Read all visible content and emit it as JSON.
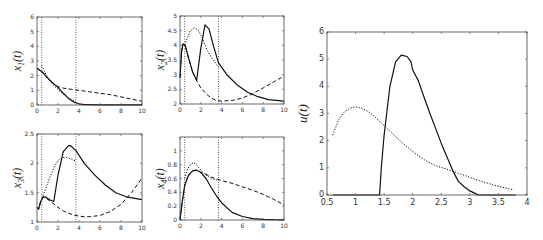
{
  "chart_data": [
    {
      "type": "line",
      "id": "x1",
      "ylabel": "x_1(t)",
      "ylabel_main": "x",
      "ylabel_sub": "1",
      "xlim": [
        0,
        10
      ],
      "ylim": [
        0,
        6
      ],
      "xticks": [
        0,
        2,
        4,
        6,
        8,
        10
      ],
      "yticks": [
        0,
        1,
        2,
        3,
        4,
        5,
        6
      ],
      "vlines": [
        0.45,
        3.7
      ],
      "series": [
        {
          "name": "solid",
          "style": "solid",
          "x": [
            0,
            0.5,
            1,
            1.5,
            2,
            2.5,
            3,
            3.5,
            4,
            4.5,
            5,
            6,
            7,
            8,
            9,
            10
          ],
          "y": [
            2.5,
            2.25,
            1.85,
            1.5,
            1.2,
            0.8,
            0.45,
            0.2,
            0.08,
            0.03,
            0.02,
            0.01,
            0.01,
            0.01,
            0.01,
            0.01
          ]
        },
        {
          "name": "dashed",
          "style": "dashed",
          "x": [
            0,
            0.5,
            1,
            1.5,
            2,
            2.5,
            3,
            4,
            5,
            6,
            7,
            8,
            9,
            10
          ],
          "y": [
            2.5,
            2.25,
            1.85,
            1.5,
            1.25,
            1.15,
            1.1,
            1.0,
            0.9,
            0.8,
            0.7,
            0.55,
            0.4,
            0.25
          ]
        },
        {
          "name": "dotted",
          "style": "dotted",
          "x": [
            0.45,
            0.7,
            1,
            1.5,
            2,
            2.5,
            3,
            3.5,
            3.7
          ],
          "y": [
            2.7,
            2.3,
            1.9,
            1.4,
            1.05,
            0.75,
            0.5,
            0.3,
            0.2
          ]
        }
      ]
    },
    {
      "type": "line",
      "id": "x2",
      "ylabel": "x_2(t)",
      "ylabel_main": "x",
      "ylabel_sub": "2",
      "xlim": [
        0,
        10
      ],
      "ylim": [
        2,
        5
      ],
      "xticks": [
        0,
        2,
        4,
        6,
        8,
        10
      ],
      "yticks": [
        2,
        2.5,
        3,
        3.5,
        4,
        4.5,
        5
      ],
      "vlines": [
        0.45,
        3.7
      ],
      "series": [
        {
          "name": "solid",
          "style": "solid",
          "x": [
            0,
            0.15,
            0.3,
            0.5,
            0.8,
            1.2,
            1.6,
            2.0,
            2.4,
            2.8,
            3.2,
            3.7,
            4.5,
            5.5,
            6.5,
            7.5,
            8.5,
            10
          ],
          "y": [
            2.9,
            3.8,
            4.05,
            4.0,
            3.6,
            3.1,
            2.8,
            3.9,
            4.7,
            4.55,
            4.0,
            3.4,
            3.0,
            2.65,
            2.4,
            2.25,
            2.15,
            2.1
          ]
        },
        {
          "name": "dashed",
          "style": "dashed",
          "x": [
            0,
            0.15,
            0.3,
            0.5,
            0.8,
            1.2,
            1.6,
            2.0,
            2.5,
            3,
            3.5,
            4,
            5,
            6,
            7,
            8,
            9,
            10
          ],
          "y": [
            2.9,
            3.8,
            4.05,
            4.0,
            3.6,
            3.1,
            2.8,
            2.55,
            2.35,
            2.2,
            2.12,
            2.1,
            2.12,
            2.2,
            2.35,
            2.55,
            2.75,
            2.95
          ]
        },
        {
          "name": "dotted",
          "style": "dotted",
          "x": [
            0.45,
            0.7,
            1.0,
            1.4,
            1.8,
            2.2,
            2.6,
            3.0,
            3.4,
            3.7
          ],
          "y": [
            4.0,
            4.25,
            4.5,
            4.6,
            4.5,
            4.2,
            3.85,
            3.6,
            3.4,
            3.25
          ]
        }
      ]
    },
    {
      "type": "line",
      "id": "x3",
      "ylabel": "x_3(t)",
      "ylabel_main": "x",
      "ylabel_sub": "3",
      "xlim": [
        0,
        10
      ],
      "ylim": [
        1,
        2.5
      ],
      "xticks": [
        0,
        2,
        4,
        6,
        8,
        10
      ],
      "yticks": [
        1,
        1.5,
        2,
        2.5
      ],
      "vlines": [
        0.45,
        3.7
      ],
      "series": [
        {
          "name": "solid",
          "style": "solid",
          "x": [
            0,
            0.15,
            0.35,
            0.6,
            0.9,
            1.2,
            1.6,
            2.0,
            2.5,
            3.0,
            3.2,
            3.7,
            4.5,
            5.5,
            6.5,
            7.5,
            8.5,
            10
          ],
          "y": [
            1.25,
            1.22,
            1.35,
            1.43,
            1.42,
            1.38,
            1.35,
            1.8,
            2.2,
            2.3,
            2.3,
            2.22,
            2.0,
            1.8,
            1.63,
            1.5,
            1.43,
            1.38
          ]
        },
        {
          "name": "dashed",
          "style": "dashed",
          "x": [
            0,
            0.15,
            0.35,
            0.6,
            0.9,
            1.5,
            2,
            2.5,
            3,
            3.5,
            4,
            4.5,
            5,
            6,
            7,
            8,
            9,
            10
          ],
          "y": [
            1.25,
            1.22,
            1.35,
            1.43,
            1.4,
            1.32,
            1.25,
            1.19,
            1.15,
            1.12,
            1.1,
            1.09,
            1.09,
            1.11,
            1.18,
            1.3,
            1.5,
            1.75
          ]
        },
        {
          "name": "dotted",
          "style": "dotted",
          "x": [
            0.45,
            0.8,
            1.2,
            1.6,
            2.0,
            2.4,
            2.8,
            3.2,
            3.5,
            3.7
          ],
          "y": [
            1.4,
            1.55,
            1.75,
            1.92,
            2.05,
            2.1,
            2.1,
            2.08,
            2.05,
            2.05
          ]
        }
      ]
    },
    {
      "type": "line",
      "id": "x4",
      "ylabel": "x_4(t)",
      "ylabel_main": "x",
      "ylabel_sub": "4",
      "xlim": [
        0,
        10
      ],
      "ylim": [
        0,
        1.2
      ],
      "xticks": [
        0,
        2,
        4,
        6,
        8,
        10
      ],
      "yticks": [
        0,
        0.2,
        0.4,
        0.6,
        0.8,
        1
      ],
      "vlines": [
        0.45,
        3.7
      ],
      "series": [
        {
          "name": "solid",
          "style": "solid",
          "x": [
            0,
            0.2,
            0.45,
            0.8,
            1.2,
            1.6,
            2.0,
            2.5,
            3.0,
            3.5,
            4.0,
            5.0,
            6.0,
            7.0,
            8.0,
            9.0,
            10
          ],
          "y": [
            0,
            0.25,
            0.5,
            0.64,
            0.71,
            0.72,
            0.69,
            0.6,
            0.47,
            0.35,
            0.25,
            0.11,
            0.05,
            0.02,
            0.01,
            0.005,
            0.003
          ]
        },
        {
          "name": "dashed",
          "style": "dashed",
          "x": [
            0,
            0.2,
            0.45,
            0.8,
            1.2,
            1.6,
            2.0,
            2.5,
            3.0,
            4,
            5,
            6,
            7,
            8,
            9,
            10
          ],
          "y": [
            0,
            0.25,
            0.5,
            0.64,
            0.71,
            0.72,
            0.69,
            0.66,
            0.62,
            0.57,
            0.53,
            0.48,
            0.43,
            0.37,
            0.3,
            0.22
          ]
        },
        {
          "name": "dotted",
          "style": "dotted",
          "x": [
            0.45,
            0.7,
            1.0,
            1.3,
            1.6,
            2.0,
            2.5,
            3.0,
            3.5,
            3.7
          ],
          "y": [
            0.6,
            0.73,
            0.8,
            0.83,
            0.8,
            0.72,
            0.65,
            0.6,
            0.58,
            0.57
          ]
        }
      ]
    },
    {
      "type": "line",
      "id": "u",
      "ylabel": "u(t)",
      "ylabel_main": "u",
      "xlim": [
        0.5,
        4
      ],
      "ylim": [
        0,
        6
      ],
      "xticks": [
        0.5,
        1,
        1.5,
        2,
        2.5,
        3,
        3.5,
        4
      ],
      "yticks": [
        0,
        1,
        2,
        3,
        4,
        5,
        6
      ],
      "series": [
        {
          "name": "solid",
          "style": "solid",
          "x": [
            0.6,
            1.42,
            1.45,
            1.5,
            1.6,
            1.7,
            1.8,
            1.9,
            1.97,
            2.0,
            2.1,
            2.2,
            2.3,
            2.4,
            2.5,
            2.6,
            2.7,
            2.8,
            2.9,
            3.0,
            3.1,
            3.15,
            3.8
          ],
          "y": [
            0,
            0,
            1.0,
            2.2,
            4.0,
            4.9,
            5.15,
            5.1,
            4.9,
            4.6,
            4.2,
            3.6,
            3.0,
            2.45,
            1.9,
            1.4,
            0.9,
            0.5,
            0.3,
            0.15,
            0.05,
            0,
            0
          ]
        },
        {
          "name": "dotted",
          "style": "dotted",
          "x": [
            0.6,
            0.7,
            0.8,
            0.9,
            1.0,
            1.1,
            1.2,
            1.3,
            1.4,
            1.5,
            1.6,
            1.8,
            2.0,
            2.2,
            2.4,
            2.6,
            2.8,
            3.0,
            3.2,
            3.4,
            3.6,
            3.75
          ],
          "y": [
            2.2,
            2.75,
            3.05,
            3.2,
            3.25,
            3.2,
            3.1,
            2.95,
            2.75,
            2.55,
            2.35,
            1.95,
            1.6,
            1.3,
            1.08,
            0.95,
            0.8,
            0.65,
            0.5,
            0.38,
            0.27,
            0.2
          ]
        }
      ]
    }
  ],
  "layout": {
    "panels": [
      {
        "id": "x1",
        "box": [
          37,
          17,
          142,
          105
        ]
      },
      {
        "id": "x2",
        "box": [
          180,
          16,
          284,
          104
        ]
      },
      {
        "id": "x3",
        "box": [
          37,
          134,
          142,
          222
        ]
      },
      {
        "id": "x4",
        "box": [
          180,
          137,
          284,
          220
        ]
      },
      {
        "id": "u",
        "box": [
          327,
          32,
          527,
          195
        ]
      }
    ]
  }
}
